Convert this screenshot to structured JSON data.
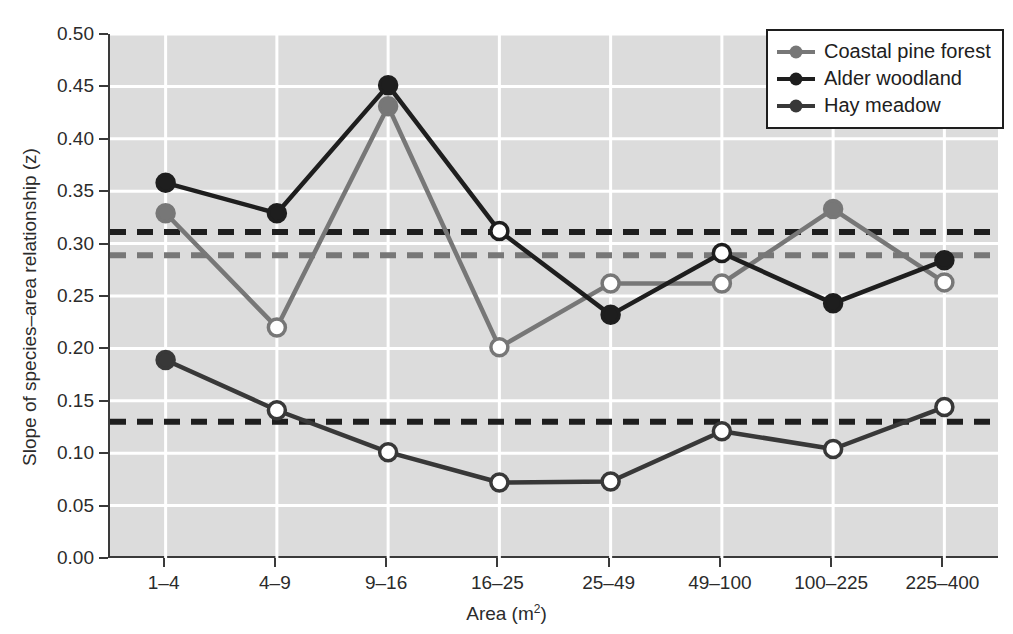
{
  "chart_data": {
    "type": "line",
    "title": "",
    "xlabel": "Area (m2)",
    "xlabel_base": "Area (m",
    "xlabel_sup": "2",
    "xlabel_tail": ")",
    "ylabel": "Slope of species–area relationship (z)",
    "categories": [
      "1–4",
      "4–9",
      "9–16",
      "16–25",
      "25–49",
      "49–100",
      "100–225",
      "225–400"
    ],
    "ylim": [
      0.0,
      0.5
    ],
    "ytick_labels": [
      "0.00",
      "0.05",
      "0.10",
      "0.15",
      "0.20",
      "0.25",
      "0.30",
      "0.35",
      "0.40",
      "0.45",
      "0.50"
    ],
    "ytick_values": [
      0.0,
      0.05,
      0.1,
      0.15,
      0.2,
      0.25,
      0.3,
      0.35,
      0.4,
      0.45,
      0.5
    ],
    "grid": true,
    "grid_color": "#ffffff",
    "plot_background": "#dcdcdc",
    "legend_position": "top-right",
    "series": [
      {
        "name": "Coastal pine forest",
        "color": "#777777",
        "values": [
          0.329,
          0.22,
          0.431,
          0.201,
          0.262,
          0.262,
          0.333,
          0.263
        ],
        "filled_markers": [
          true,
          false,
          true,
          false,
          false,
          false,
          true,
          false
        ],
        "reference_line": 0.289,
        "reference_line_color": "#777777"
      },
      {
        "name": "Alder woodland",
        "color": "#1e1e1e",
        "values": [
          0.358,
          0.329,
          0.451,
          0.312,
          0.232,
          0.291,
          0.243,
          0.284
        ],
        "filled_markers": [
          true,
          true,
          true,
          false,
          true,
          false,
          true,
          true
        ],
        "reference_line": 0.311,
        "reference_line_color": "#1e1e1e"
      },
      {
        "name": "Hay meadow",
        "color": "#383838",
        "values": [
          0.189,
          0.141,
          0.101,
          0.072,
          0.073,
          0.121,
          0.104,
          0.144
        ],
        "filled_markers": [
          true,
          false,
          false,
          false,
          false,
          false,
          false,
          false
        ],
        "reference_line": 0.13,
        "reference_line_color": "#1e1e1e"
      }
    ]
  },
  "legend": {
    "items": [
      {
        "label": "Coastal pine forest"
      },
      {
        "label": "Alder woodland"
      },
      {
        "label": "Hay meadow"
      }
    ]
  }
}
